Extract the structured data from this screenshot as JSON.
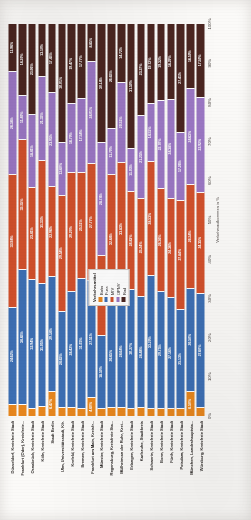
{
  "chart_data": {
    "type": "bar",
    "orientation": "horizontal-stacked-rotated",
    "title": "",
    "xlabel": "Verkehrsaufkommen in %",
    "ylabel": "",
    "xlim": [
      0,
      100
    ],
    "xticks": [
      "0%",
      "10%",
      "20%",
      "30%",
      "40%",
      "50%",
      "60%",
      "70%",
      "80%",
      "90%",
      "100%"
    ],
    "grid": false,
    "legend": {
      "title": "Verkehrsmittel",
      "position": "inside-center",
      "entries": [
        {
          "name": "Bahn",
          "color": "#E8871E"
        },
        {
          "name": "Fuss",
          "color": "#3D6FB4"
        },
        {
          "name": "MIV",
          "color": "#D2512C"
        },
        {
          "name": "ÖPNV",
          "color": "#9B77C4"
        },
        {
          "name": "Rad",
          "color": "#4A2520"
        }
      ]
    },
    "series": [
      {
        "name": "Bahn",
        "color": "#E8871E"
      },
      {
        "name": "Fuss",
        "color": "#3D6FB4"
      },
      {
        "name": "MIV",
        "color": "#D2512C"
      },
      {
        "name": "ÖPNV",
        "color": "#9B77C4"
      },
      {
        "name": "Rad",
        "color": "#4A2520"
      }
    ],
    "categories": [
      "Düsseldorf, Kreisfreie Stadt",
      "Frankfurt (Oder), Kreisfreie...",
      "Osnabrück, Kreisfreie Stadt",
      "Köln, Kreisfreie Stadt",
      "Stadt Berlin",
      "Ulm, Universitätsstadt, Kfr.",
      "Krefeld, Kreisfreie Stadt",
      "Bremen, Kreisfreie Stadt",
      "Frankfurt am Main, Kreisfr...",
      "Münster, Kreisfreie Stadt",
      "Regensburg, Kreisfreie Sta...",
      "Mülheim an der Ruhr, Krei...",
      "Erlangen, Kreisfreie Stadt",
      "Karlsruhe, Stadtkreis",
      "Schwerin, Kreisfreie Stadt",
      "Bonn, Kreisfreie Stadt",
      "Fürth, Kreisfreie Stadt",
      "Potsdam, Kreisfreie Stadt",
      "München, Landeshauptsta...",
      "Würzburg, Kreisfreie Stadt"
    ],
    "rows": [
      {
        "category": "Düsseldorf, Kreisfreie Stadt",
        "values": {
          "Bahn": 3.1,
          "Fuss": 24.62,
          "MIV": 33.94,
          "OPNV": 26.38,
          "Rad": 11.96
        },
        "labels": {
          "Bahn": "",
          "Fuss": "24.62%",
          "MIV": "33.94%",
          "OPNV": "26.38%",
          "Rad": "11.96%"
        }
      },
      {
        "category": "Frankfurt (Oder), Kreisfreie...",
        "values": {
          "Bahn": 3.0,
          "Fuss": 34.85,
          "MIV": 33.55,
          "OPNV": 11.4,
          "Rad": 18.2
        },
        "labels": {
          "Bahn": "",
          "Fuss": "34.85%",
          "MIV": "33.55%",
          "OPNV": "11.40%",
          "Rad": "18.20%"
        }
      },
      {
        "category": "Osnabrück, Kreisfreie Stadt",
        "values": {
          "Bahn": 2.1,
          "Fuss": 32.94,
          "MIV": 23.41,
          "OPNV": 18.41,
          "Rad": 23.06
        },
        "labels": {
          "Bahn": "",
          "Fuss": "32.94%",
          "MIV": "23.41%",
          "OPNV": "18.41%",
          "Rad": "23.06%"
        }
      },
      {
        "category": "Köln, Kreisfreie Stadt",
        "values": {
          "Bahn": 2.6,
          "Fuss": 31.05,
          "MIV": 31.33,
          "OPNV": 21.33,
          "Rad": 13.1
        },
        "labels": {
          "Bahn": "",
          "Fuss": "31.05%",
          "MIV": "31.33%",
          "OPNV": "21.33%",
          "Rad": "13.10%"
        }
      },
      {
        "category": "Stadt Berlin",
        "values": {
          "Bahn": 6.47,
          "Fuss": 29.14,
          "MIV": 22.96,
          "OPNV": 23.95,
          "Rad": 17.45
        },
        "labels": {
          "Bahn": "6.47%",
          "Fuss": "29.14%",
          "MIV": "22.96%",
          "OPNV": "23.95%",
          "Rad": "17.45%"
        }
      },
      {
        "category": "Ulm, Universitätsstadt, Kfr.",
        "values": {
          "Bahn": 2.3,
          "Fuss": 24.63,
          "MIV": 29.54,
          "OPNV": 13.6,
          "Rad": 30.01
        },
        "labels": {
          "Bahn": "",
          "Fuss": "24.63%",
          "MIV": "29.54%",
          "OPNV": "13.60%",
          "Rad": "30.01%"
        }
      },
      {
        "category": "Krefeld, Kreisfreie Stadt",
        "values": {
          "Bahn": 2.2,
          "Fuss": 28.42,
          "MIV": 29.29,
          "OPNV": 16.79,
          "Rad": 19.47
        },
        "labels": {
          "Bahn": "",
          "Fuss": "28.42%",
          "MIV": "29.29%",
          "OPNV": "16.79%",
          "Rad": "19.47%"
        }
      },
      {
        "category": "Bremen, Kreisfreie Stadt",
        "values": {
          "Bahn": 2.0,
          "Fuss": 31.03,
          "MIV": 25.51,
          "OPNV": 17.54,
          "Rad": 17.77
        },
        "labels": {
          "Bahn": "",
          "Fuss": "31.03%",
          "MIV": "25.51%",
          "OPNV": "17.54%",
          "Rad": "17.77%"
        }
      },
      {
        "category": "Frankfurt am Main, Kreisfr...",
        "values": {
          "Bahn": 4.6,
          "Fuss": 27.51,
          "MIV": 27.77,
          "OPNV": 24.01,
          "Rad": 8.85
        },
        "labels": {
          "Bahn": "4.60%",
          "Fuss": "27.51%",
          "MIV": "27.77%",
          "OPNV": "24.01%",
          "Rad": "8.85%"
        }
      },
      {
        "category": "Münster, Kreisfreie Stadt",
        "values": {
          "Bahn": 2.1,
          "Fuss": 18.5,
          "MIV": 20.46,
          "OPNV": 28.74,
          "Rad": 30.14
        },
        "labels": {
          "Bahn": "",
          "Fuss": "18.50%",
          "MIV": "20.46%",
          "OPNV": "28.74%",
          "Rad": "30.14%"
        }
      },
      {
        "category": "Regensburg, Kreisfreie Sta...",
        "values": {
          "Bahn": 2.2,
          "Fuss": 26.65,
          "MIV": 32.84,
          "OPNV": 11.7,
          "Rad": 26.65
        },
        "labels": {
          "Bahn": "",
          "Fuss": "26.65%",
          "MIV": "32.84%",
          "OPNV": "11.70%",
          "Rad": "26.65%"
        }
      },
      {
        "category": "Mülheim an der Ruhr, Krei...",
        "values": {
          "Bahn": 2.3,
          "Fuss": 28.64,
          "MIV": 33.83,
          "OPNV": 20.51,
          "Rad": 14.72
        },
        "labels": {
          "Bahn": "",
          "Fuss": "28.64%",
          "MIV": "33.83%",
          "OPNV": "20.51%",
          "Rad": "14.72%"
        }
      },
      {
        "category": "Erlangen, Kreisfreie Stadt",
        "values": {
          "Bahn": 2.1,
          "Fuss": 30.27,
          "MIV": 24.83,
          "OPNV": 11.03,
          "Rad": 31.5
        },
        "labels": {
          "Bahn": "",
          "Fuss": "30.27%",
          "MIV": "24.83%",
          "OPNV": "11.03%",
          "Rad": "31.50%"
        }
      },
      {
        "category": "Karlsruhe, Stadtkreis",
        "values": {
          "Bahn": 2.2,
          "Fuss": 28.48,
          "MIV": 25.24,
          "OPNV": 21.25,
          "Rad": 23.27
        },
        "labels": {
          "Bahn": "",
          "Fuss": "28.48%",
          "MIV": "25.24%",
          "OPNV": "21.25%",
          "Rad": "23.27%"
        }
      },
      {
        "category": "Schwerin, Kreisfreie Stadt",
        "values": {
          "Bahn": 2.0,
          "Fuss": 33.2,
          "MIV": 28.53,
          "OPNV": 14.51,
          "Rad": 19.72
        },
        "labels": {
          "Bahn": "",
          "Fuss": "33.20%",
          "MIV": "28.53%",
          "OPNV": "14.51%",
          "Rad": "19.72%"
        }
      },
      {
        "category": "Bonn, Kreisfreie Stadt",
        "values": {
          "Bahn": 2.1,
          "Fuss": 29.75,
          "MIV": 26.36,
          "OPNV": 22.7,
          "Rad": 19.32
        },
        "labels": {
          "Bahn": "",
          "Fuss": "29.75%",
          "MIV": "26.36%",
          "OPNV": "22.70%",
          "Rad": "19.32%"
        }
      },
      {
        "category": "Fürth, Kreisfreie Stadt",
        "values": {
          "Bahn": 2.0,
          "Fuss": 27.18,
          "MIV": 24.38,
          "OPNV": 24.38,
          "Rad": 18.29
        },
        "labels": {
          "Bahn": "",
          "Fuss": "27.18%",
          "MIV": "24.38%",
          "OPNV": "24.38%",
          "Rad": "18.29%"
        }
      },
      {
        "category": "Potsdam, Kreisfreie Stadt",
        "values": {
          "Bahn": 2.1,
          "Fuss": 25.13,
          "MIV": 27.84,
          "OPNV": 17.26,
          "Rad": 27.41
        },
        "labels": {
          "Bahn": "",
          "Fuss": "25.13%",
          "MIV": "27.84%",
          "OPNV": "17.26%",
          "Rad": "27.41%"
        }
      },
      {
        "category": "München, Landeshauptsta...",
        "values": {
          "Bahn": 6.5,
          "Fuss": 26.5,
          "MIV": 26.54,
          "OPNV": 24.63,
          "Rad": 16.5
        },
        "labels": {
          "Bahn": "6.50%",
          "Fuss": "26.50%",
          "MIV": "26.54%",
          "OPNV": "24.63%",
          "Rad": "16.50%"
        }
      },
      {
        "category": "Würzburg, Kreisfreie Stadt",
        "values": {
          "Bahn": 2.1,
          "Fuss": 27.6,
          "MIV": 24.35,
          "OPNV": 22.92,
          "Rad": 17.5
        },
        "labels": {
          "Bahn": "",
          "Fuss": "27.60%",
          "MIV": "24.35%",
          "OPNV": "22.92%",
          "Rad": "17.50%"
        }
      }
    ]
  }
}
